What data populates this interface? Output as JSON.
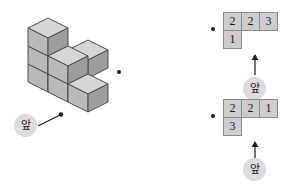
{
  "figure": {
    "colors": {
      "cube_top": "#d6d6d6",
      "cube_left": "#b9b9b9",
      "cube_right": "#9d9d9d",
      "cube_stroke": "#4d4d4d",
      "cell_fill": "#cdcdcd",
      "cell_stroke": "#8a8a8a",
      "badge_fill": "#dcdcdc",
      "ink": "#1a1a1a"
    }
  },
  "solid": {
    "label": "cube-stack",
    "front_badge": "앞",
    "pointer": "leader-line-to-front-face",
    "cube_count": 7,
    "columns": [
      {
        "position": "front-left",
        "height": 3
      },
      {
        "position": "front-middle",
        "height": 2
      },
      {
        "position": "front-right",
        "height": 1
      },
      {
        "position": "back-middle",
        "height": 1
      }
    ]
  },
  "bullets": {
    "solid_marker": "•",
    "top_grid_marker": "•",
    "bottom_grid_marker": "•"
  },
  "grids": [
    {
      "name": "top-plan-grid",
      "front_badge": "앞",
      "arrow": "up-arrow",
      "rows": [
        [
          "2",
          "2",
          "3"
        ],
        [
          "1",
          "",
          ""
        ]
      ]
    },
    {
      "name": "bottom-plan-grid",
      "front_badge": "앞",
      "arrow": "up-arrow",
      "rows": [
        [
          "2",
          "2",
          "1"
        ],
        [
          "3",
          "",
          ""
        ]
      ]
    }
  ]
}
